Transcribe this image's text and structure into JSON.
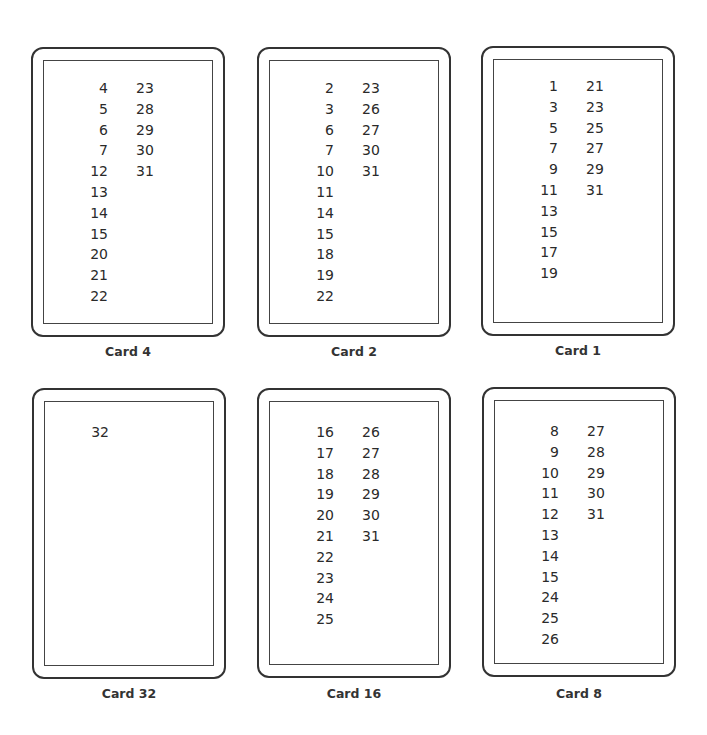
{
  "cards": [
    {
      "label": "Card 4",
      "left_column": [
        "4",
        "5",
        "6",
        "7",
        "12",
        "13",
        "14",
        "15",
        "20",
        "21",
        "22"
      ],
      "right_column": [
        "23",
        "28",
        "29",
        "30",
        "31"
      ]
    },
    {
      "label": "Card 2",
      "left_column": [
        "2",
        "3",
        "6",
        "7",
        "10",
        "11",
        "14",
        "15",
        "18",
        "19",
        "22"
      ],
      "right_column": [
        "23",
        "26",
        "27",
        "30",
        "31"
      ]
    },
    {
      "label": "Card 1",
      "left_column": [
        "1",
        "3",
        "5",
        "7",
        "9",
        "11",
        "13",
        "15",
        "17",
        "19"
      ],
      "right_column": [
        "21",
        "23",
        "25",
        "27",
        "29",
        "31"
      ]
    },
    {
      "label": "Card 32",
      "left_column": [
        "32"
      ],
      "right_column": []
    },
    {
      "label": "Card 16",
      "left_column": [
        "16",
        "17",
        "18",
        "19",
        "20",
        "21",
        "22",
        "23",
        "24",
        "25"
      ],
      "right_column": [
        "26",
        "27",
        "28",
        "29",
        "30",
        "31"
      ]
    },
    {
      "label": "Card 8",
      "left_column": [
        "8",
        "9",
        "10",
        "11",
        "12",
        "13",
        "14",
        "15",
        "24",
        "25",
        "26"
      ],
      "right_column": [
        "27",
        "28",
        "29",
        "30",
        "31"
      ]
    }
  ]
}
